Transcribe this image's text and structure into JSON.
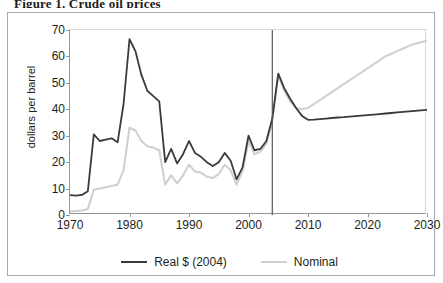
{
  "figure": {
    "title_clipped": "Figure 1.  Crude oil prices",
    "frame_color": "#a7a9ac",
    "background": "#ffffff"
  },
  "legend": {
    "position": "bottom-center",
    "entries": [
      {
        "label": "Real $ (2004)",
        "color": "#3a3a3c"
      },
      {
        "label": "Nominal",
        "color": "#cfd0d1"
      }
    ]
  },
  "chart_data": {
    "type": "line",
    "title": "",
    "xlabel": "",
    "ylabel": "dollars per barrel",
    "xlim": [
      1970,
      2030
    ],
    "ylim": [
      0,
      70
    ],
    "xticks": [
      1970,
      1980,
      1990,
      2000,
      2010,
      2020,
      2030
    ],
    "xticklabels": [
      "1970",
      "1980",
      "1990",
      "2000",
      "2010",
      "2020",
      "2030"
    ],
    "yticks": [
      0,
      10,
      20,
      30,
      40,
      50,
      60,
      70
    ],
    "yticklabels": [
      "0",
      "10",
      "20",
      "30",
      "40",
      "50",
      "60",
      "70"
    ],
    "grid": false,
    "annotations": [
      {
        "type": "vline",
        "x": 2004,
        "label": "history / projection divider",
        "color": "#58595b"
      }
    ],
    "series": [
      {
        "name": "Real $ (2004)",
        "color": "#3a3a3c",
        "x": [
          1970,
          1971,
          1972,
          1973,
          1974,
          1975,
          1976,
          1977,
          1978,
          1979,
          1980,
          1981,
          1982,
          1983,
          1984,
          1985,
          1986,
          1987,
          1988,
          1989,
          1990,
          1991,
          1992,
          1993,
          1994,
          1995,
          1996,
          1997,
          1998,
          1999,
          2000,
          2001,
          2002,
          2003,
          2004,
          2005,
          2006,
          2007,
          2008,
          2009,
          2010,
          2011,
          2012,
          2013,
          2014,
          2015,
          2016,
          2017,
          2018,
          2019,
          2020,
          2021,
          2022,
          2023,
          2024,
          2025,
          2026,
          2027,
          2028,
          2029,
          2030
        ],
        "values": [
          7.5,
          7.3,
          7.6,
          9.0,
          30.5,
          28.0,
          28.5,
          29.0,
          27.5,
          42.0,
          66.5,
          62.0,
          53.0,
          47.0,
          45.0,
          43.0,
          20.0,
          25.0,
          19.5,
          23.0,
          28.0,
          23.5,
          22.0,
          20.0,
          18.5,
          20.0,
          23.5,
          20.5,
          13.5,
          18.0,
          30.0,
          24.5,
          25.0,
          28.0,
          36.5,
          53.5,
          48.0,
          44.0,
          40.5,
          37.5,
          36.0,
          36.1,
          36.3,
          36.5,
          36.7,
          36.9,
          37.0,
          37.2,
          37.4,
          37.6,
          37.8,
          38.0,
          38.2,
          38.4,
          38.6,
          38.8,
          39.0,
          39.2,
          39.4,
          39.6,
          39.8
        ]
      },
      {
        "name": "Nominal",
        "color": "#cfd0d1",
        "x": [
          1970,
          1971,
          1972,
          1973,
          1974,
          1975,
          1976,
          1977,
          1978,
          1979,
          1980,
          1981,
          1982,
          1983,
          1984,
          1985,
          1986,
          1987,
          1988,
          1989,
          1990,
          1991,
          1992,
          1993,
          1994,
          1995,
          1996,
          1997,
          1998,
          1999,
          2000,
          2001,
          2002,
          2003,
          2004,
          2005,
          2006,
          2007,
          2008,
          2009,
          2010,
          2011,
          2012,
          2013,
          2014,
          2015,
          2016,
          2017,
          2018,
          2019,
          2020,
          2021,
          2022,
          2023,
          2024,
          2025,
          2026,
          2027,
          2028,
          2029,
          2030
        ],
        "values": [
          1.3,
          1.5,
          1.7,
          2.3,
          9.5,
          10.0,
          10.5,
          11.0,
          11.5,
          17.0,
          33.0,
          32.0,
          28.0,
          26.0,
          25.5,
          24.5,
          11.5,
          15.0,
          12.0,
          15.0,
          19.0,
          16.5,
          16.0,
          14.5,
          14.0,
          15.5,
          19.0,
          17.0,
          11.5,
          16.5,
          28.0,
          23.0,
          24.0,
          27.0,
          35.5,
          53.0,
          47.0,
          43.0,
          40.5,
          40.0,
          40.5,
          42.0,
          43.5,
          45.0,
          46.5,
          48.0,
          49.5,
          51.0,
          52.5,
          54.0,
          55.5,
          57.0,
          58.5,
          60.0,
          61.0,
          62.0,
          63.0,
          64.0,
          64.8,
          65.4,
          66.0
        ]
      }
    ]
  }
}
